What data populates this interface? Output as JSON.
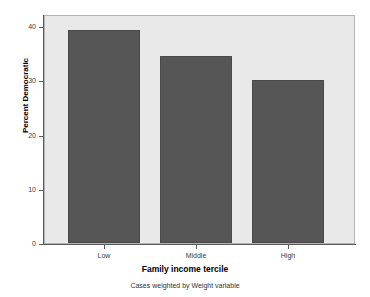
{
  "chart_data": {
    "type": "bar",
    "title": "",
    "categories": [
      "Low",
      "Middle",
      "High"
    ],
    "values": [
      39.3,
      34.5,
      30.1
    ],
    "series": [
      {
        "name": "Percent Democratic",
        "values": [
          39.3,
          34.5,
          30.1
        ]
      }
    ],
    "xlabel": "Family income tercile",
    "ylabel": "Percent Democratic",
    "ylim": [
      0,
      42.2
    ],
    "xlim": [
      0,
      3
    ],
    "yticks": [
      0,
      10,
      20,
      30,
      40
    ],
    "ytick_labels": [
      "0",
      "10",
      "20",
      "30",
      "40"
    ],
    "xtick_labels": [
      "Low",
      "Middle",
      "High"
    ],
    "grid": false,
    "legend": null,
    "footnote": "Cases weighted by Weight variable",
    "colors": {
      "bar_fill": "#565656",
      "bar_border": "#4a4a4a",
      "plot_background": "#e9e9e9",
      "plot_border": "#b4b4b4",
      "page_background": "#ffffff",
      "axis_line": "#5a5a5a",
      "text": "#000000"
    }
  }
}
